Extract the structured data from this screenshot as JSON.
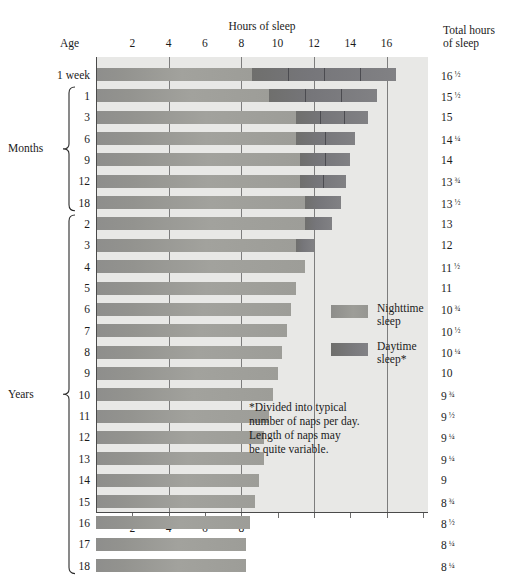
{
  "titles": {
    "hours_of_sleep": "Hours of sleep",
    "age": "Age",
    "total_hours_line1": "Total hours",
    "total_hours_line2": "of sleep"
  },
  "groups": {
    "months": "Months",
    "years": "Years"
  },
  "legend": {
    "night_line1": "Nighttime",
    "night_line2": "sleep",
    "day_line1": "Daytime",
    "day_line2": "sleep*",
    "night_color": "#9a9a96",
    "day_color": "#76767a"
  },
  "footnote": {
    "line1": "*Divided into typical",
    "line2": "number of naps per day.",
    "line3": "Length of naps may",
    "line4": "be quite variable."
  },
  "axis": {
    "top_ticks": [
      "2",
      "4",
      "6",
      "8",
      "10",
      "12",
      "14",
      "16"
    ],
    "bottom_ticks": [
      "2",
      "4",
      "6",
      "8"
    ],
    "gridlines": [
      4,
      8,
      12,
      16
    ],
    "xmin": 0,
    "xmax": 18.3,
    "unit": "hours"
  },
  "chart_data": {
    "type": "bar",
    "title": "Hours of sleep",
    "xlabel": "Hours of sleep",
    "ylabel": "Age",
    "xlim": [
      0,
      18.3
    ],
    "grid": true,
    "legend_position": "right",
    "stacked": true,
    "series": [
      {
        "name": "Nighttime sleep",
        "color": "#9a9a96"
      },
      {
        "name": "Daytime sleep*",
        "color": "#76767a"
      }
    ],
    "categories": [
      "1 week",
      "1",
      "3",
      "6",
      "9",
      "12",
      "18",
      "2",
      "3",
      "4",
      "5",
      "6",
      "7",
      "8",
      "9",
      "10",
      "11",
      "12",
      "13",
      "14",
      "15",
      "16",
      "17",
      "18"
    ],
    "rows": [
      {
        "age": "1 week",
        "group": "week",
        "total": 16.5,
        "total_label": "16",
        "total_frac": "1/2",
        "night": 8.6,
        "day": 7.9,
        "naps": 4
      },
      {
        "age": "1",
        "group": "months",
        "total": 15.5,
        "total_label": "15",
        "total_frac": "1/2",
        "night": 9.5,
        "day": 6.0,
        "naps": 3
      },
      {
        "age": "3",
        "group": "months",
        "total": 15.0,
        "total_label": "15",
        "total_frac": "",
        "night": 11.0,
        "day": 4.0,
        "naps": 3
      },
      {
        "age": "6",
        "group": "months",
        "total": 14.25,
        "total_label": "14",
        "total_frac": "1/4",
        "night": 11.0,
        "day": 3.25,
        "naps": 2
      },
      {
        "age": "9",
        "group": "months",
        "total": 14.0,
        "total_label": "14",
        "total_frac": "",
        "night": 11.25,
        "day": 2.75,
        "naps": 2
      },
      {
        "age": "12",
        "group": "months",
        "total": 13.75,
        "total_label": "13",
        "total_frac": "3/4",
        "night": 11.25,
        "day": 2.5,
        "naps": 2
      },
      {
        "age": "18",
        "group": "months",
        "total": 13.5,
        "total_label": "13",
        "total_frac": "1/2",
        "night": 11.5,
        "day": 2.0,
        "naps": 1
      },
      {
        "age": "2",
        "group": "years",
        "total": 13.0,
        "total_label": "13",
        "total_frac": "",
        "night": 11.5,
        "day": 1.5,
        "naps": 1
      },
      {
        "age": "3",
        "group": "years",
        "total": 12.0,
        "total_label": "12",
        "total_frac": "",
        "night": 11.0,
        "day": 1.0,
        "naps": 1
      },
      {
        "age": "4",
        "group": "years",
        "total": 11.5,
        "total_label": "11",
        "total_frac": "1/2",
        "night": 11.5,
        "day": 0,
        "naps": 0
      },
      {
        "age": "5",
        "group": "years",
        "total": 11.0,
        "total_label": "11",
        "total_frac": "",
        "night": 11.0,
        "day": 0,
        "naps": 0
      },
      {
        "age": "6",
        "group": "years",
        "total": 10.75,
        "total_label": "10",
        "total_frac": "3/4",
        "night": 10.75,
        "day": 0,
        "naps": 0
      },
      {
        "age": "7",
        "group": "years",
        "total": 10.5,
        "total_label": "10",
        "total_frac": "1/2",
        "night": 10.5,
        "day": 0,
        "naps": 0
      },
      {
        "age": "8",
        "group": "years",
        "total": 10.25,
        "total_label": "10",
        "total_frac": "1/4",
        "night": 10.25,
        "day": 0,
        "naps": 0
      },
      {
        "age": "9",
        "group": "years",
        "total": 10.0,
        "total_label": "10",
        "total_frac": "",
        "night": 10.0,
        "day": 0,
        "naps": 0
      },
      {
        "age": "10",
        "group": "years",
        "total": 9.75,
        "total_label": "9",
        "total_frac": "3/4",
        "night": 9.75,
        "day": 0,
        "naps": 0
      },
      {
        "age": "11",
        "group": "years",
        "total": 9.5,
        "total_label": "9",
        "total_frac": "1/2",
        "night": 9.5,
        "day": 0,
        "naps": 0
      },
      {
        "age": "12",
        "group": "years",
        "total": 9.25,
        "total_label": "9",
        "total_frac": "1/4",
        "night": 9.25,
        "day": 0,
        "naps": 0
      },
      {
        "age": "13",
        "group": "years",
        "total": 9.25,
        "total_label": "9",
        "total_frac": "1/4",
        "night": 9.25,
        "day": 0,
        "naps": 0
      },
      {
        "age": "14",
        "group": "years",
        "total": 9.0,
        "total_label": "9",
        "total_frac": "",
        "night": 9.0,
        "day": 0,
        "naps": 0
      },
      {
        "age": "15",
        "group": "years",
        "total": 8.75,
        "total_label": "8",
        "total_frac": "3/4",
        "night": 8.75,
        "day": 0,
        "naps": 0
      },
      {
        "age": "16",
        "group": "years",
        "total": 8.5,
        "total_label": "8",
        "total_frac": "1/2",
        "night": 8.5,
        "day": 0,
        "naps": 0
      },
      {
        "age": "17",
        "group": "years",
        "total": 8.25,
        "total_label": "8",
        "total_frac": "1/4",
        "night": 8.25,
        "day": 0,
        "naps": 0
      },
      {
        "age": "18",
        "group": "years",
        "total": 8.25,
        "total_label": "8",
        "total_frac": "1/4",
        "night": 8.25,
        "day": 0,
        "naps": 0
      }
    ]
  }
}
